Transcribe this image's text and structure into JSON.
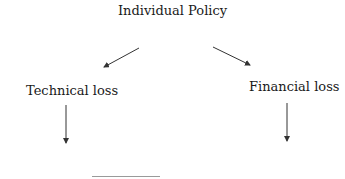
{
  "diagram": {
    "type": "tree",
    "nodes": [
      {
        "id": "root",
        "label": "Individual Policy"
      },
      {
        "id": "technical",
        "label": "Technical loss"
      },
      {
        "id": "financial",
        "label": "Financial loss"
      }
    ],
    "edges": [
      {
        "from": "root",
        "to": "technical"
      },
      {
        "from": "root",
        "to": "financial"
      },
      {
        "from": "technical",
        "to": "below-technical"
      },
      {
        "from": "financial",
        "to": "below-financial"
      }
    ],
    "colors": {
      "stroke": "#333333",
      "text": "#1a1a1a",
      "background": "#ffffff"
    }
  }
}
